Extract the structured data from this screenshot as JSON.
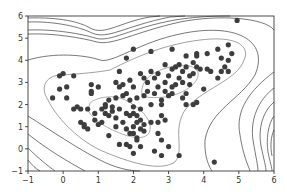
{
  "chart_data": {
    "type": "scatter",
    "title": "",
    "xlabel": "",
    "ylabel": "",
    "xlim": [
      -1,
      6
    ],
    "ylim": [
      -1,
      6
    ],
    "xticks": [
      -1,
      0,
      1,
      2,
      3,
      4,
      5,
      6
    ],
    "yticks": [
      -1,
      0,
      1,
      2,
      3,
      4,
      5,
      6
    ],
    "grid": false,
    "legend": null,
    "overlay": "density contour lines (gaussian mixture / KDE level sets), two inner peaks near (1.5, 1.5) and (3.0, 3.0)",
    "colors": {
      "points": "#3d3d3d",
      "inner_contours": "#8a8a8a",
      "outer_contours": "#444444",
      "frame": "#222222"
    },
    "series": [
      {
        "name": "samples",
        "points": [
          [
            -0.3,
            2.3
          ],
          [
            -0.1,
            3.3
          ],
          [
            0.0,
            3.4
          ],
          [
            -0.1,
            2.7
          ],
          [
            0.1,
            2.8
          ],
          [
            0.1,
            2.3
          ],
          [
            0.3,
            3.3
          ],
          [
            0.3,
            1.8
          ],
          [
            0.4,
            1.9
          ],
          [
            0.5,
            1.8
          ],
          [
            0.5,
            1.2
          ],
          [
            0.6,
            1.0
          ],
          [
            0.6,
            1.1
          ],
          [
            0.7,
            0.9
          ],
          [
            0.7,
            1.8
          ],
          [
            0.8,
            2.9
          ],
          [
            0.8,
            2.6
          ],
          [
            0.8,
            2.5
          ],
          [
            0.9,
            1.3
          ],
          [
            0.9,
            1.6
          ],
          [
            1.0,
            2.8
          ],
          [
            1.0,
            1.1
          ],
          [
            1.1,
            1.2
          ],
          [
            1.1,
            1.8
          ],
          [
            1.2,
            1.6
          ],
          [
            1.2,
            1.9
          ],
          [
            1.2,
            2.0
          ],
          [
            1.3,
            2.2
          ],
          [
            1.3,
            1.5
          ],
          [
            1.3,
            0.6
          ],
          [
            1.4,
            1.9
          ],
          [
            1.4,
            1.7
          ],
          [
            1.5,
            1.4
          ],
          [
            1.5,
            1.0
          ],
          [
            1.5,
            2.3
          ],
          [
            1.5,
            3.0
          ],
          [
            1.6,
            3.5
          ],
          [
            1.6,
            2.8
          ],
          [
            1.6,
            1.8
          ],
          [
            1.7,
            1.2
          ],
          [
            1.7,
            2.4
          ],
          [
            1.7,
            2.9
          ],
          [
            1.8,
            2.5
          ],
          [
            1.8,
            1.6
          ],
          [
            1.8,
            0.9
          ],
          [
            1.8,
            0.2
          ],
          [
            1.9,
            1.5
          ],
          [
            1.9,
            2.2
          ],
          [
            1.9,
            3.1
          ],
          [
            1.9,
            0.1
          ],
          [
            2.0,
            1.6
          ],
          [
            2.0,
            1.9
          ],
          [
            2.0,
            1.0
          ],
          [
            2.0,
            0.7
          ],
          [
            2.0,
            2.8
          ],
          [
            2.1,
            1.2
          ],
          [
            2.1,
            2.3
          ],
          [
            2.1,
            0.5
          ],
          [
            2.1,
            0.4
          ],
          [
            2.1,
            1.5
          ],
          [
            2.2,
            0.9
          ],
          [
            2.2,
            1.3
          ],
          [
            2.2,
            1.8
          ],
          [
            2.2,
            3.4
          ],
          [
            2.3,
            2.4
          ],
          [
            2.3,
            1.1
          ],
          [
            2.3,
            0.8
          ],
          [
            2.3,
            3.2
          ],
          [
            2.4,
            3.0
          ],
          [
            2.4,
            2.6
          ],
          [
            2.5,
            3.5
          ],
          [
            2.5,
            2.0
          ],
          [
            2.5,
            1.2
          ],
          [
            2.6,
            2.5
          ],
          [
            2.6,
            3.2
          ],
          [
            2.7,
            2.8
          ],
          [
            2.7,
            3.4
          ],
          [
            2.7,
            0.7
          ],
          [
            2.7,
            1.2
          ],
          [
            2.8,
            2.2
          ],
          [
            2.8,
            2.0
          ],
          [
            2.8,
            1.5
          ],
          [
            2.8,
            0.4
          ],
          [
            2.9,
            3.8
          ],
          [
            2.9,
            3.0
          ],
          [
            2.9,
            2.6
          ],
          [
            2.9,
            1.3
          ],
          [
            3.0,
            3.3
          ],
          [
            3.0,
            2.4
          ],
          [
            3.0,
            0.1
          ],
          [
            3.1,
            3.6
          ],
          [
            3.1,
            2.8
          ],
          [
            3.1,
            2.5
          ],
          [
            3.1,
            4.5
          ],
          [
            3.2,
            3.7
          ],
          [
            3.2,
            2.9
          ],
          [
            3.3,
            3.2
          ],
          [
            3.3,
            3.8
          ],
          [
            3.4,
            2.3
          ],
          [
            3.4,
            3.0
          ],
          [
            3.4,
            3.5
          ],
          [
            3.5,
            3.7
          ],
          [
            3.5,
            4.2
          ],
          [
            3.5,
            2.5
          ],
          [
            3.5,
            2.0
          ],
          [
            3.6,
            3.3
          ],
          [
            3.6,
            2.9
          ],
          [
            3.7,
            3.9
          ],
          [
            3.7,
            3.4
          ],
          [
            3.7,
            2.0
          ],
          [
            3.8,
            4.3
          ],
          [
            3.8,
            4.2
          ],
          [
            3.8,
            3.7
          ],
          [
            3.8,
            2.1
          ],
          [
            3.9,
            3.6
          ],
          [
            4.0,
            2.7
          ],
          [
            4.1,
            4.3
          ],
          [
            4.1,
            3.6
          ],
          [
            4.2,
            3.5
          ],
          [
            4.4,
            4.5
          ],
          [
            4.4,
            3.2
          ],
          [
            4.5,
            4.1
          ],
          [
            4.5,
            3.5
          ],
          [
            4.6,
            3.7
          ],
          [
            4.7,
            4.7
          ],
          [
            4.7,
            4.0
          ],
          [
            4.7,
            3.5
          ],
          [
            4.8,
            4.3
          ],
          [
            2.5,
            4.4
          ],
          [
            2.0,
            4.5
          ],
          [
            1.8,
            4.1
          ],
          [
            2.2,
            0.1
          ],
          [
            2.0,
            -0.2
          ],
          [
            2.6,
            -0.1
          ],
          [
            2.8,
            -0.3
          ],
          [
            3.3,
            -0.3
          ],
          [
            4.3,
            -0.6
          ],
          [
            4.95,
            5.8
          ],
          [
            1.6,
            0.2
          ],
          [
            1.9,
            0.7
          ]
        ]
      }
    ]
  },
  "axes": {
    "x_tick_labels": [
      "−1",
      "0",
      "1",
      "2",
      "3",
      "4",
      "5",
      "6"
    ],
    "y_tick_labels": [
      "−1",
      "0",
      "1",
      "2",
      "3",
      "4",
      "5",
      "6"
    ]
  }
}
